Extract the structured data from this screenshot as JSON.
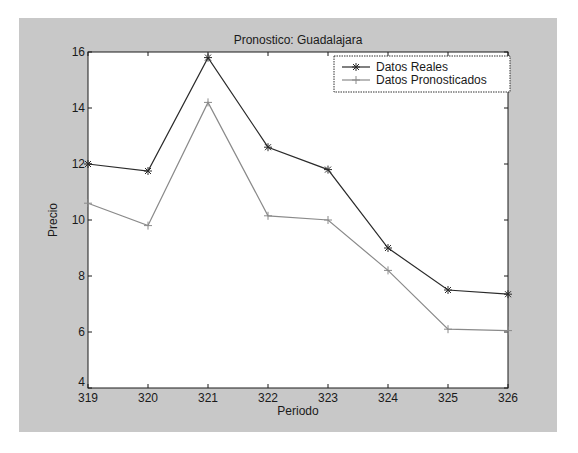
{
  "chart_data": {
    "type": "line",
    "title": "Pronostico: Guadalajara",
    "xlabel": "Periodo",
    "ylabel": "Precio",
    "x": [
      319,
      320,
      321,
      322,
      323,
      324,
      325,
      326
    ],
    "xlim": [
      319,
      326
    ],
    "ylim": [
      4,
      16
    ],
    "xticks": [
      "319",
      "320",
      "321",
      "322",
      "323",
      "324",
      "325",
      "326"
    ],
    "yticks": [
      "4",
      "6",
      "8",
      "10",
      "12",
      "14",
      "16"
    ],
    "grid": false,
    "legend_position": "upper right",
    "series": [
      {
        "name": "Datos Reales",
        "marker": "*",
        "color": "#2a2a2a",
        "values": [
          12.0,
          11.75,
          15.8,
          12.6,
          11.8,
          9.0,
          7.5,
          7.35
        ]
      },
      {
        "name": "Datos Pronosticados",
        "marker": "+",
        "color": "#8a8a8a",
        "values": [
          10.6,
          9.8,
          14.2,
          10.15,
          10.0,
          8.2,
          6.1,
          6.05
        ]
      }
    ]
  },
  "figure": {
    "background": "#c8c8c8",
    "axes_background": "#ffffff"
  },
  "legend": {
    "items": [
      {
        "label": "Datos Reales"
      },
      {
        "label": "Datos Pronosticados"
      }
    ]
  }
}
